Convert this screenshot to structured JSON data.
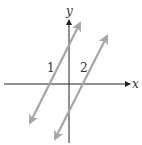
{
  "diagram": {
    "type": "coordinate-plane",
    "colors": {
      "axis": "#222222",
      "line": "#a6a6a6",
      "text": "#333333",
      "background": "#ffffff"
    },
    "axes": {
      "x_label": "x",
      "y_label": "y"
    },
    "lines": [
      {
        "label": "1",
        "x1": 30,
        "y1": 123,
        "x2": 80,
        "y2": 23
      },
      {
        "label": "2",
        "x1": 55,
        "y1": 139,
        "x2": 107,
        "y2": 36
      }
    ]
  }
}
